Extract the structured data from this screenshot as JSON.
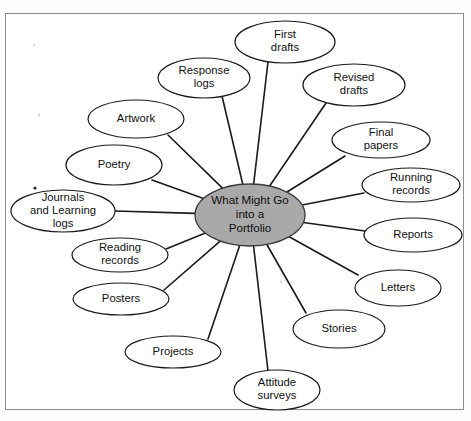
{
  "diagram": {
    "type": "spoke-and-hub concept map",
    "center": {
      "id": "center-node",
      "lines": [
        "What Might Go",
        "into a",
        "Portfolio"
      ],
      "fill_color": "#a9a9a9",
      "stroke_color": "#3a3a3a",
      "cx": 250,
      "cy": 215,
      "rx": 55,
      "ry": 31
    },
    "frame": {
      "border_color": "#8d8d8d",
      "background_color": "#ffffff"
    },
    "nodes": [
      {
        "id": "node-first-drafts",
        "lines": [
          "First",
          "drafts"
        ],
        "cx": 285,
        "cy": 42,
        "rx": 50,
        "ry": 21,
        "anchor_x": 268,
        "anchor_y": 62
      },
      {
        "id": "node-response-logs",
        "lines": [
          "Response",
          "logs"
        ],
        "cx": 204,
        "cy": 78,
        "rx": 46,
        "ry": 20,
        "anchor_x": 222,
        "anchor_y": 96
      },
      {
        "id": "node-revised-drafts",
        "lines": [
          "Revised",
          "drafts"
        ],
        "cx": 354,
        "cy": 85,
        "rx": 51,
        "ry": 21,
        "anchor_x": 326,
        "anchor_y": 103
      },
      {
        "id": "node-artwork",
        "lines": [
          "Artwork"
        ],
        "cx": 136,
        "cy": 119,
        "rx": 48,
        "ry": 19,
        "anchor_x": 168,
        "anchor_y": 135
      },
      {
        "id": "node-final-papers",
        "lines": [
          "Final",
          "papers"
        ],
        "cx": 381,
        "cy": 140,
        "rx": 49,
        "ry": 18,
        "anchor_x": 345,
        "anchor_y": 156
      },
      {
        "id": "node-poetry",
        "lines": [
          "Poetry"
        ],
        "cx": 114,
        "cy": 165,
        "rx": 48,
        "ry": 20,
        "anchor_x": 152,
        "anchor_y": 180
      },
      {
        "id": "node-running-records",
        "lines": [
          "Running",
          "records"
        ],
        "cx": 411,
        "cy": 185,
        "rx": 49,
        "ry": 17,
        "anchor_x": 364,
        "anchor_y": 193
      },
      {
        "id": "node-journals",
        "lines": [
          "Journals",
          "and Learning",
          "logs"
        ],
        "cx": 63,
        "cy": 211,
        "rx": 52,
        "ry": 21,
        "anchor_x": 115,
        "anchor_y": 211
      },
      {
        "id": "node-reports",
        "lines": [
          "Reports"
        ],
        "cx": 413,
        "cy": 235,
        "rx": 49,
        "ry": 17,
        "anchor_x": 365,
        "anchor_y": 231
      },
      {
        "id": "node-reading-records",
        "lines": [
          "Reading",
          "records"
        ],
        "cx": 120,
        "cy": 255,
        "rx": 48,
        "ry": 17,
        "anchor_x": 166,
        "anchor_y": 249
      },
      {
        "id": "node-letters",
        "lines": [
          "Letters"
        ],
        "cx": 398,
        "cy": 288,
        "rx": 43,
        "ry": 18,
        "anchor_x": 358,
        "anchor_y": 275
      },
      {
        "id": "node-posters",
        "lines": [
          "Posters"
        ],
        "cx": 121,
        "cy": 299,
        "rx": 48,
        "ry": 16,
        "anchor_x": 164,
        "anchor_y": 290
      },
      {
        "id": "node-stories",
        "lines": [
          "Stories"
        ],
        "cx": 339,
        "cy": 329,
        "rx": 46,
        "ry": 19,
        "anchor_x": 306,
        "anchor_y": 313
      },
      {
        "id": "node-projects",
        "lines": [
          "Projects"
        ],
        "cx": 173,
        "cy": 352,
        "rx": 48,
        "ry": 16,
        "anchor_x": 208,
        "anchor_y": 339
      },
      {
        "id": "node-attitude-surveys",
        "lines": [
          "Attitude",
          "surveys"
        ],
        "cx": 277,
        "cy": 390,
        "rx": 43,
        "ry": 20,
        "anchor_x": 268,
        "anchor_y": 371
      }
    ]
  }
}
